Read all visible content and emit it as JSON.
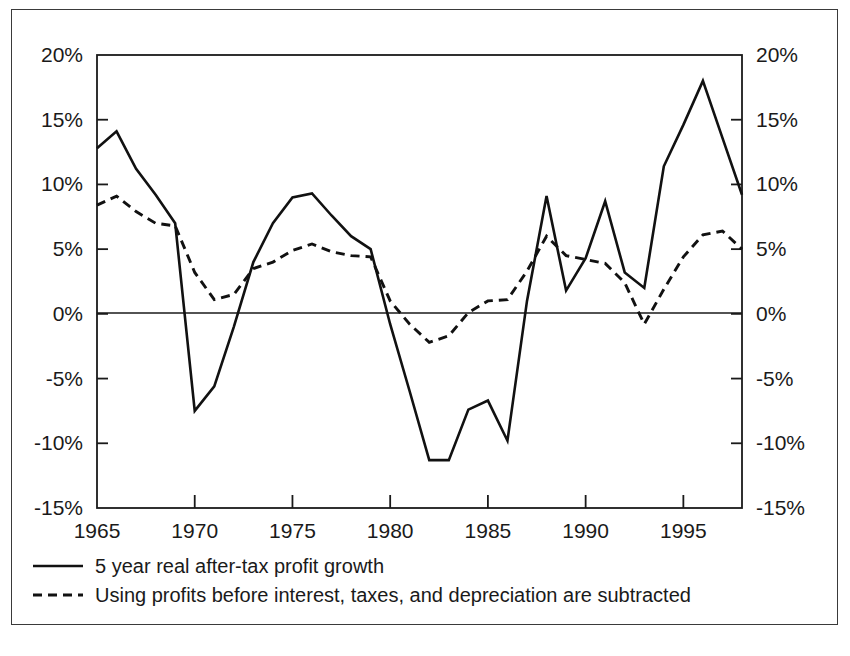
{
  "chart_data": {
    "type": "line",
    "title": "",
    "subtitle": "",
    "xlabel": "",
    "ylabel": "",
    "xlim": [
      1965,
      1998
    ],
    "ylim": [
      -15,
      20
    ],
    "y_unit": "%",
    "grid": false,
    "legend_position": "below-axes-left",
    "dual_y_axis": true,
    "y_ticks": [
      20,
      15,
      10,
      5,
      0,
      -5,
      -10,
      -15
    ],
    "y_tick_labels": [
      "20%",
      "15%",
      "10%",
      "5%",
      "0%",
      "-5%",
      "-10%",
      "-15%"
    ],
    "y_ticks_right": [
      20,
      15,
      10,
      5,
      0,
      -5,
      -10,
      -15
    ],
    "y_tick_labels_right": [
      "20%",
      "15%",
      "10%",
      "5%",
      "0%",
      "-5%",
      "-10%",
      "-15%"
    ],
    "x_ticks": [
      1965,
      1970,
      1975,
      1980,
      1985,
      1990,
      1995
    ],
    "x_tick_labels": [
      "1965",
      "1970",
      "1975",
      "1980",
      "1985",
      "1990",
      "1995"
    ],
    "zero_reference_line": 0,
    "x": [
      1965,
      1966,
      1967,
      1968,
      1969,
      1970,
      1971,
      1972,
      1973,
      1974,
      1975,
      1976,
      1977,
      1978,
      1979,
      1980,
      1981,
      1982,
      1983,
      1984,
      1985,
      1986,
      1987,
      1988,
      1989,
      1990,
      1991,
      1992,
      1993,
      1994,
      1995,
      1996,
      1997,
      1998
    ],
    "series": [
      {
        "name": "5 year real after-tax profit growth",
        "style": "solid",
        "values": [
          12.8,
          14.1,
          11.2,
          9.2,
          7.0,
          -7.5,
          -5.6,
          -1.0,
          4.0,
          7.0,
          9.0,
          9.3,
          7.6,
          6.0,
          5.0,
          -0.8,
          -6.0,
          -11.3,
          -11.3,
          -7.4,
          -6.7,
          -9.8,
          1.0,
          9.1,
          1.8,
          4.3,
          8.7,
          3.2,
          2.0,
          11.4,
          14.6,
          18.0,
          13.6,
          9.2
        ]
      },
      {
        "name": "Using profits before interest, taxes, and depreciation are subtracted",
        "style": "dashed",
        "values": [
          8.4,
          9.1,
          7.9,
          7.0,
          6.8,
          3.2,
          1.1,
          1.5,
          3.5,
          4.0,
          4.9,
          5.4,
          4.8,
          4.5,
          4.4,
          1.0,
          -0.8,
          -2.2,
          -1.7,
          0.1,
          1.0,
          1.1,
          3.3,
          6.0,
          4.5,
          4.2,
          3.9,
          2.4,
          -0.8,
          1.9,
          4.4,
          6.1,
          6.4,
          5.0
        ]
      }
    ]
  },
  "legend": {
    "items": [
      {
        "label": "5 year real after-tax profit growth",
        "style": "solid"
      },
      {
        "label": "Using profits before interest, taxes, and depreciation are subtracted",
        "style": "dashed"
      }
    ]
  },
  "colors": {
    "line": "#111111",
    "frame": "#1a1a1a",
    "background": "#ffffff"
  }
}
